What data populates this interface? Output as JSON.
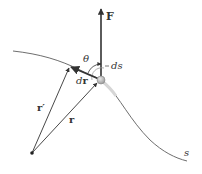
{
  "diagram": {
    "colors": {
      "background": "#ffffff",
      "line": "#333333",
      "curve": "#6e6e6e",
      "particle_fill": "#bdbdbd",
      "particle_stroke": "#8a8a8a"
    },
    "labels": {
      "force": "F",
      "angle": "θ",
      "arc_length": "ds",
      "displacement_d": "d",
      "displacement_r": "r",
      "position_prime": "r′",
      "position": "r",
      "path": "s"
    }
  }
}
